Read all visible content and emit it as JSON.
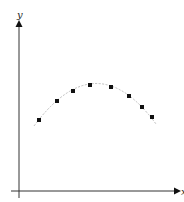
{
  "chart_data": {
    "type": "scatter",
    "title": "",
    "xlabel": "x",
    "ylabel": "y",
    "grid": false,
    "legend": null,
    "ticks": {
      "x": [],
      "y": []
    },
    "points_px": [
      {
        "x": 39,
        "y": 120
      },
      {
        "x": 57,
        "y": 101
      },
      {
        "x": 73,
        "y": 91
      },
      {
        "x": 90,
        "y": 85
      },
      {
        "x": 111,
        "y": 87
      },
      {
        "x": 129,
        "y": 96
      },
      {
        "x": 142,
        "y": 107
      },
      {
        "x": 152,
        "y": 117
      }
    ],
    "series": [
      {
        "name": "data points",
        "style": "markers",
        "x": [
          1,
          2,
          3,
          4,
          5,
          6,
          7,
          8
        ],
        "values": [
          3.2,
          4.3,
          4.9,
          5.2,
          5.1,
          4.6,
          4.0,
          3.4
        ]
      },
      {
        "name": "fitted curve",
        "style": "dashed-line",
        "description": "downward-opening parabola fitted through the points"
      }
    ],
    "curve": {
      "start_px": [
        34,
        126
      ],
      "apex_px": [
        96,
        84
      ],
      "end_px": [
        156,
        124
      ]
    }
  },
  "axes": {
    "x_label": "x",
    "y_label": "y"
  },
  "colors": {
    "axis": "#333333",
    "point": "#111111",
    "curve": "#bbbbbb"
  }
}
